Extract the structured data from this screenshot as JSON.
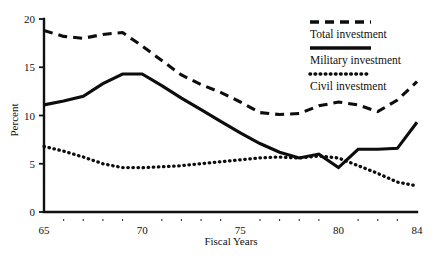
{
  "chart_data": {
    "type": "line",
    "title": "",
    "xlabel": "Fiscal Years",
    "ylabel": "Percent",
    "xlim": [
      65,
      84
    ],
    "ylim": [
      0,
      20
    ],
    "grid": false,
    "legend_position": "top-right",
    "x": [
      65,
      66,
      67,
      68,
      69,
      70,
      71,
      72,
      73,
      74,
      75,
      76,
      77,
      78,
      79,
      80,
      81,
      82,
      83,
      84
    ],
    "x_tick_labels": [
      "65",
      "70",
      "75",
      "80",
      "84"
    ],
    "x_major_ticks": [
      65,
      70,
      75,
      80,
      84
    ],
    "y_tick_labels": [
      "0",
      "5",
      "10",
      "15",
      "20"
    ],
    "y_major_ticks": [
      0,
      5,
      10,
      15,
      20
    ],
    "series": [
      {
        "name": "Total investment",
        "style": "dashed",
        "color": "#0d0d0d",
        "values": [
          18.8,
          18.2,
          18.0,
          18.4,
          18.6,
          17.2,
          15.7,
          14.2,
          13.2,
          12.4,
          11.4,
          10.3,
          10.1,
          10.2,
          11.0,
          11.4,
          11.1,
          10.4,
          11.6,
          13.5
        ]
      },
      {
        "name": "Military investment",
        "style": "solid",
        "color": "#0d0d0d",
        "values": [
          11.1,
          11.5,
          12.0,
          13.3,
          14.3,
          14.3,
          13.1,
          11.8,
          10.6,
          9.4,
          8.2,
          7.1,
          6.2,
          5.6,
          6.0,
          4.6,
          6.5,
          6.5,
          6.6,
          9.3
        ]
      },
      {
        "name": "Civil investment",
        "style": "dotted",
        "color": "#0d0d0d",
        "values": [
          6.8,
          6.3,
          5.7,
          5.0,
          4.6,
          4.6,
          4.7,
          4.8,
          5.0,
          5.2,
          5.4,
          5.6,
          5.7,
          5.6,
          5.8,
          5.6,
          4.8,
          4.0,
          3.1,
          2.7
        ]
      }
    ]
  },
  "legend": {
    "items": [
      {
        "label": "Total investment",
        "style": "dashed"
      },
      {
        "label": "Military investment",
        "style": "solid"
      },
      {
        "label": "Civil investment",
        "style": "dotted"
      }
    ]
  },
  "axes": {
    "y_title": "Percent",
    "x_title": "Fiscal Years"
  }
}
